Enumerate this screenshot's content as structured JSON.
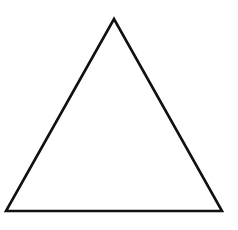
{
  "figure": {
    "shape": "triangle",
    "kind": "equilateral-outline",
    "vertices": {
      "apex": [
        114,
        19
      ],
      "bottom_left": [
        6,
        211
      ],
      "bottom_right": [
        222,
        211
      ]
    },
    "stroke_color": "#111111",
    "fill_color": "#ffffff",
    "stroke_width": 2.6,
    "background": "#ffffff"
  }
}
